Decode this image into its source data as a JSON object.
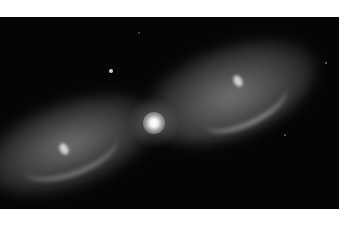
{
  "image": {
    "subject": "bipolar planetary nebula",
    "style": "grayscale astronomical photograph",
    "colors": {
      "page_background": "#ffffff",
      "sky": "#050505",
      "nebula_glow": "#969696",
      "core": "#ffffff"
    },
    "features": [
      {
        "name": "central-star",
        "description": "bright white core at center"
      },
      {
        "name": "right-lobe",
        "description": "upper-right gaseous lobe"
      },
      {
        "name": "left-lobe",
        "description": "lower-left gaseous lobe"
      },
      {
        "name": "field-star",
        "description": "small star upper left of center"
      }
    ]
  }
}
